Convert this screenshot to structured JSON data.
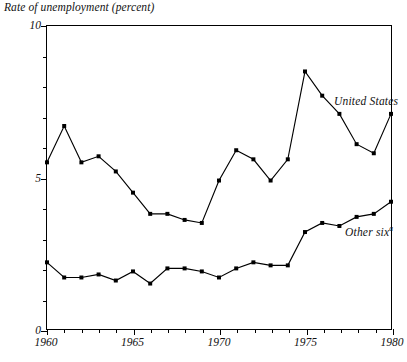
{
  "chart_data": {
    "type": "line",
    "title": "Rate of unemployment (percent)",
    "subtitle": "",
    "xlabel": "",
    "ylabel": "Rate of unemployment (percent)",
    "xlim": [
      1960,
      1980
    ],
    "ylim": [
      0,
      10
    ],
    "x_tick_labels": [
      "1960",
      "1965",
      "1970",
      "1975",
      "1980"
    ],
    "x_major_ticks": [
      1960,
      1965,
      1970,
      1975,
      1980
    ],
    "x_minor_ticks": [
      1961,
      1962,
      1963,
      1964,
      1966,
      1967,
      1968,
      1969,
      1971,
      1972,
      1973,
      1974,
      1976,
      1977,
      1978,
      1979
    ],
    "y_tick_labels": [
      "0",
      "5",
      "10"
    ],
    "y_major_ticks": [
      0,
      5,
      10
    ],
    "y_minor_ticks": [
      1,
      2,
      3,
      4,
      6,
      7,
      8,
      9
    ],
    "grid": false,
    "legend_position": "inline-annotation",
    "marker": "square",
    "x": [
      1960,
      1961,
      1962,
      1963,
      1964,
      1965,
      1966,
      1967,
      1968,
      1969,
      1970,
      1971,
      1972,
      1973,
      1974,
      1975,
      1976,
      1977,
      1978,
      1979,
      1980
    ],
    "series": [
      {
        "name": "United States",
        "label": "United States",
        "values": [
          5.5,
          6.7,
          5.5,
          5.7,
          5.2,
          4.5,
          3.8,
          3.8,
          3.6,
          3.5,
          4.9,
          5.9,
          5.6,
          4.9,
          5.6,
          8.5,
          7.7,
          7.1,
          6.1,
          5.8,
          7.1
        ]
      },
      {
        "name": "Other six",
        "label": "Other six",
        "label_footnote": "a",
        "values": [
          2.2,
          1.7,
          1.7,
          1.8,
          1.6,
          1.9,
          1.5,
          2.0,
          2.0,
          1.9,
          1.7,
          2.0,
          2.2,
          2.1,
          2.1,
          3.2,
          3.5,
          3.4,
          3.7,
          3.8,
          4.2
        ]
      }
    ]
  },
  "annotations": {
    "united_states": "United States",
    "other_six": "Other six",
    "other_six_footnote": "a"
  },
  "colors": {
    "line": "#000000",
    "axis": "#000000",
    "background": "#ffffff"
  }
}
